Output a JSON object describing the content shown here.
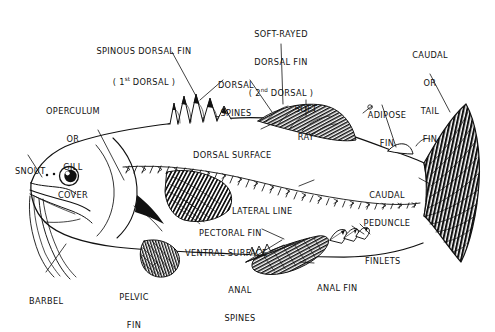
{
  "diagram": {
    "background_color": "#ffffff",
    "ink_color": "#111111"
  },
  "labels": [
    {
      "name": "spinous-dorsal-fin",
      "lines": [
        "SPINOUS DORSAL FIN",
        "( 1st DORSAL )"
      ],
      "line1": "SPINOUS DORSAL FIN",
      "line2_pre": "( 1",
      "line2_sup": "st",
      "line2_post": " DORSAL )",
      "x": 144,
      "y": 28,
      "align": "ctr"
    },
    {
      "name": "soft-rayed-dorsal-fin",
      "line1": "SOFT-RAYED",
      "line2": "DORSAL FIN",
      "line3_pre": "( 2",
      "line3_sup": "nd",
      "line3_post": " DORSAL )",
      "x": 281,
      "y": 11,
      "align": "ctr"
    },
    {
      "name": "caudal-or-tail-fin",
      "line1": "CAUDAL",
      "line2": "OR",
      "line3": "TAIL",
      "line4": "FIN",
      "x": 430,
      "y": 32,
      "align": "ctr"
    },
    {
      "name": "dorsal-spines",
      "line1": "DORSAL",
      "line2": "SPINES",
      "x": 236,
      "y": 62,
      "align": "ctr"
    },
    {
      "name": "soft-ray",
      "line1": "SOFT",
      "line2": "RAY",
      "x": 306,
      "y": 86,
      "align": "ctr"
    },
    {
      "name": "adipose-fin",
      "line1": "ADIPOSE",
      "line2": "FIN",
      "x": 387,
      "y": 92,
      "align": "ctr"
    },
    {
      "name": "operculum-or-gill-cover",
      "line1": "OPERCULUM",
      "line2": "OR",
      "line3": "GILL",
      "line4": "COVER",
      "x": 73,
      "y": 88,
      "align": "ctr"
    },
    {
      "name": "dorsal-surface",
      "line1": "DORSAL SURFACE",
      "x": 193,
      "y": 132,
      "align": "lft"
    },
    {
      "name": "snout",
      "line1": "SNOUT",
      "x": 15,
      "y": 148,
      "align": "lft"
    },
    {
      "name": "lateral-line",
      "line1": "LATERAL LINE",
      "x": 232,
      "y": 188,
      "align": "lft"
    },
    {
      "name": "caudal-peduncle",
      "line1": "CAUDAL",
      "line2": "PEDUNCLE",
      "x": 387,
      "y": 172,
      "align": "ctr"
    },
    {
      "name": "pectoral-fin",
      "line1": "PECTORAL FIN",
      "x": 199,
      "y": 210,
      "align": "lft"
    },
    {
      "name": "ventral-surface",
      "line1": "VENTRAL SURFACE",
      "x": 185,
      "y": 230,
      "align": "lft"
    },
    {
      "name": "finlets",
      "line1": "FINLETS",
      "x": 365,
      "y": 238,
      "align": "lft"
    },
    {
      "name": "anal-fin",
      "line1": "ANAL FIN",
      "x": 317,
      "y": 265,
      "align": "lft"
    },
    {
      "name": "anal-spines",
      "line1": "ANAL",
      "line2": "SPINES",
      "x": 240,
      "y": 267,
      "align": "ctr"
    },
    {
      "name": "pelvic-fin",
      "line1": "PELVIC",
      "line2": "FIN",
      "x": 134,
      "y": 274,
      "align": "ctr"
    },
    {
      "name": "barbel",
      "line1": "BARBEL",
      "x": 29,
      "y": 278,
      "align": "lft"
    }
  ],
  "parts": [
    "spinous dorsal fin",
    "soft-rayed dorsal fin",
    "caudal or tail fin",
    "dorsal spines",
    "soft ray",
    "adipose fin",
    "operculum or gill cover",
    "dorsal surface",
    "snout",
    "lateral line",
    "caudal peduncle",
    "pectoral fin",
    "ventral surface",
    "finlets",
    "anal fin",
    "anal spines",
    "pelvic fin",
    "barbel"
  ]
}
